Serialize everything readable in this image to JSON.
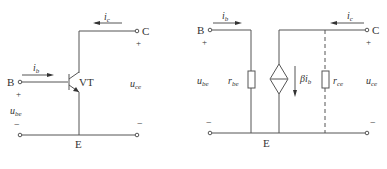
{
  "left_circuit": {
    "title": "BJT common-emitter",
    "transistor_label": "VT",
    "terminals": {
      "base": "B",
      "collector": "C",
      "emitter": "E"
    },
    "currents": {
      "ib": "i",
      "ib_sub": "b",
      "ic": "i",
      "ic_sub": "c"
    },
    "voltages": {
      "ube": "u",
      "ube_sub": "be",
      "uce": "u",
      "uce_sub": "ce"
    },
    "polarity": {
      "plus": "+",
      "minus": "−"
    }
  },
  "right_circuit": {
    "title": "Small-signal equivalent",
    "terminals": {
      "base": "B",
      "collector": "C",
      "emitter": "E"
    },
    "currents": {
      "ib": "i",
      "ib_sub": "b",
      "ic": "i",
      "ic_sub": "c"
    },
    "voltages": {
      "ube": "u",
      "ube_sub": "be",
      "uce": "u",
      "uce_sub": "ce"
    },
    "components": {
      "rbe": "r",
      "rbe_sub": "be",
      "rce": "r",
      "rce_sub": "ce",
      "source": "βi",
      "source_sub": "b"
    },
    "polarity": {
      "plus": "+",
      "minus": "−"
    }
  }
}
